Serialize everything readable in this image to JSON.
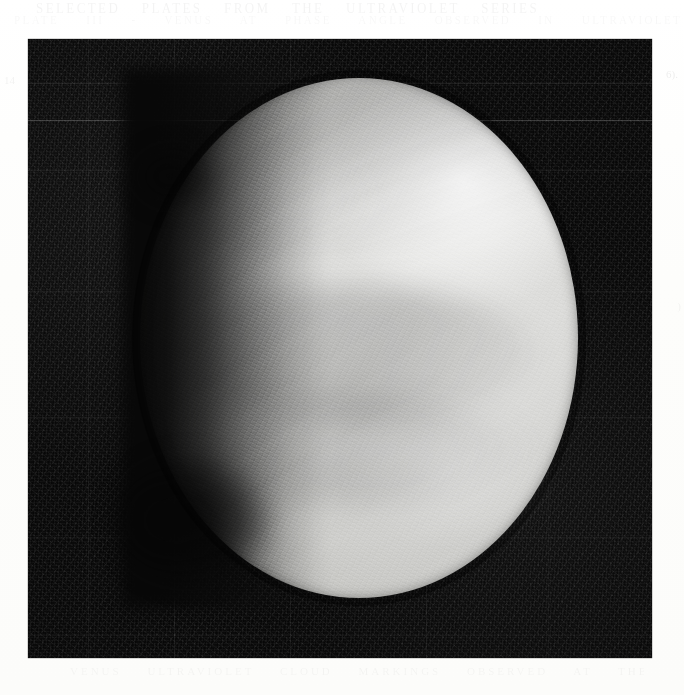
{
  "page": {
    "background_color": "#fdfdfc",
    "ghost_text_top_line1": "SELECTED  PLATES  FROM  THE  ULTRAVIOLET  SERIES",
    "ghost_text_top_line2": "PLATE  III  -  VENUS  AT  PHASE  ANGLE  OBSERVED  IN  ULTRAVIOLET  LIGHT",
    "ghost_text_left": "14",
    "ghost_text_right": "6).",
    "ghost_text_right_lower": ")",
    "ghost_text_bottom": "VENUS   ULTRAVIOLET   CLOUD   MARKINGS   OBSERVED   AT   THE   OBSERVATORY"
  },
  "plate": {
    "label": "venus-ultraviolet-photograph",
    "frame_color": "#0a0a0a",
    "left": 28,
    "top": 39,
    "width": 624,
    "height": 619,
    "sky_color": "#0b0b0b",
    "scanlines": [
      {
        "name": "bright-scanline",
        "y": 81,
        "opacity": 0.21
      },
      {
        "name": "reseau-line-h-1",
        "y": 44,
        "opacity": 0.085
      },
      {
        "name": "reseau-line-h-2",
        "y": 131,
        "opacity": 0.06
      },
      {
        "name": "reseau-line-h-3",
        "y": 252,
        "opacity": 0.05
      },
      {
        "name": "reseau-line-h-4",
        "y": 378,
        "opacity": 0.05
      },
      {
        "name": "reseau-line-h-5",
        "y": 498,
        "opacity": 0.045
      },
      {
        "name": "reseau-line-h-6",
        "y": 596,
        "opacity": 0.04
      }
    ],
    "reseau_vertical": [
      {
        "name": "reseau-line-v-1",
        "x": 60,
        "opacity": 0.05
      },
      {
        "name": "reseau-line-v-2",
        "x": 146,
        "opacity": 0.05
      },
      {
        "name": "reseau-line-v-3",
        "x": 262,
        "opacity": 0.04
      },
      {
        "name": "reseau-line-v-4",
        "x": 398,
        "opacity": 0.04
      },
      {
        "name": "reseau-line-v-5",
        "x": 520,
        "opacity": 0.035
      }
    ]
  },
  "subject": {
    "name": "venus-disc",
    "body": "Venus",
    "phase": "gibbous",
    "illumination_direction": "right",
    "disc_center_x": 359,
    "disc_center_y": 338,
    "disc_width": 438,
    "disc_height": 520,
    "features": [
      {
        "name": "bright-limb-arc",
        "location": "upper-right",
        "brightness": "brightest"
      },
      {
        "name": "polar-hood-band",
        "location": "north-polar",
        "brightness": "dark"
      },
      {
        "name": "mid-latitude-cloud-band",
        "location": "equatorial",
        "brightness": "dark"
      },
      {
        "name": "lower-cloud-band",
        "location": "south-mid-latitude",
        "brightness": "dark"
      },
      {
        "name": "bright-cloud-streak",
        "location": "lower-right",
        "brightness": "bright"
      },
      {
        "name": "terminator",
        "location": "left-limb",
        "brightness": "shadowed"
      },
      {
        "name": "terminator-notch",
        "location": "lower-left",
        "brightness": "darkest"
      }
    ],
    "tone_range": {
      "shadow": "#0a0a0a",
      "midtone": "#9a9a97",
      "highlight": "#f2f2f0"
    }
  }
}
